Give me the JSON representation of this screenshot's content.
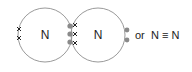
{
  "diagram": {
    "type": "dot-and-cross",
    "molecule": "N2",
    "atoms": [
      {
        "symbol": "N",
        "lone_pair": "xx",
        "bond_electrons": "xxx"
      },
      {
        "symbol": "N",
        "lone_pair": "••",
        "bond_electrons": "•••"
      }
    ],
    "connector_text": "or",
    "structural_formula": "N ≡ N",
    "colors": {
      "circle": "#999999",
      "dot": "#8a8a8a",
      "cross": "#222222"
    }
  }
}
